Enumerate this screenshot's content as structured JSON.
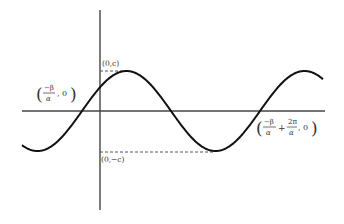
{
  "diagram": {
    "title": "",
    "function": "y = c·sin(αx + β)",
    "labels": {
      "max_point": "(0,c)",
      "min_point": "(0,−c)",
      "left_zero": {
        "open": "(",
        "num": "−β",
        "den": "α",
        "tail": ", 0)"
      },
      "right_zero": {
        "open": "(",
        "num1": "−β",
        "den1": "α",
        "plus": "+",
        "num2": "2π",
        "den2": "α",
        "tail": ", 0)"
      }
    },
    "colors": {
      "curve": "#111111",
      "axis": "#444444",
      "dashed": "#555555",
      "text": "#333333"
    }
  }
}
